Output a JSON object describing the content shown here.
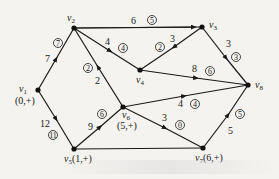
{
  "diagram": {
    "type": "network-flow",
    "nodes": [
      {
        "id": "v1",
        "name": "v",
        "sub": "1",
        "mark": "(0,+)",
        "x": 38,
        "y": 90
      },
      {
        "id": "v2",
        "name": "v",
        "sub": "2",
        "mark": "",
        "x": 74,
        "y": 28
      },
      {
        "id": "v3",
        "name": "v",
        "sub": "3",
        "mark": "",
        "x": 202,
        "y": 27
      },
      {
        "id": "v4",
        "name": "v",
        "sub": "4",
        "mark": "",
        "x": 140,
        "y": 70
      },
      {
        "id": "v5",
        "name": "v",
        "sub": "5",
        "mark": "(1,+)",
        "x": 74,
        "y": 149
      },
      {
        "id": "v6",
        "name": "v",
        "sub": "6",
        "mark": "(5,+)",
        "x": 123,
        "y": 107
      },
      {
        "id": "v7",
        "name": "v",
        "sub": "7",
        "mark": "(6,+)",
        "x": 203,
        "y": 148
      },
      {
        "id": "v8",
        "name": "v",
        "sub": "8",
        "mark": "",
        "x": 248,
        "y": 85
      }
    ],
    "edges": [
      {
        "from": "v1",
        "to": "v2",
        "capacity": "7",
        "flow": "7"
      },
      {
        "from": "v1",
        "to": "v5",
        "capacity": "12",
        "flow": "11"
      },
      {
        "from": "v2",
        "to": "v3",
        "capacity": "6",
        "flow": "5"
      },
      {
        "from": "v2",
        "to": "v4",
        "capacity": "4",
        "flow": "4"
      },
      {
        "from": "v6",
        "to": "v2",
        "capacity": "2",
        "flow": "2"
      },
      {
        "from": "v3",
        "to": "v4",
        "capacity": "3",
        "flow": "2"
      },
      {
        "from": "v3",
        "to": "v8",
        "capacity": "3",
        "flow": "3"
      },
      {
        "from": "v4",
        "to": "v8",
        "capacity": "8",
        "flow": "6"
      },
      {
        "from": "v5",
        "to": "v6",
        "capacity": "9",
        "flow": "6"
      },
      {
        "from": "v6",
        "to": "v8",
        "capacity": "4",
        "flow": "4"
      },
      {
        "from": "v6",
        "to": "v7",
        "capacity": "3",
        "flow": "0"
      },
      {
        "from": "v7",
        "to": "v8",
        "capacity": "5",
        "flow": "5"
      },
      {
        "from": "v5",
        "to": "v7",
        "capacity": "",
        "flow": ""
      }
    ]
  },
  "labels": {
    "v1": {
      "name": "v",
      "sub": "1",
      "mark": "(0,+)"
    },
    "v2": {
      "name": "v",
      "sub": "2"
    },
    "v3": {
      "name": "v",
      "sub": "3"
    },
    "v4": {
      "name": "v",
      "sub": "4"
    },
    "v5": {
      "name": "v",
      "sub": "5",
      "mark": "(1,+)"
    },
    "v6": {
      "name": "v",
      "sub": "6",
      "mark": "(5,+)"
    },
    "v7": {
      "name": "v",
      "sub": "7",
      "mark": "(6,+)"
    },
    "v8": {
      "name": "v",
      "sub": "8"
    },
    "e12": {
      "cap": "7",
      "flow": "7"
    },
    "e15": {
      "cap": "12",
      "flow": "11"
    },
    "e23": {
      "cap": "6",
      "flow": "5"
    },
    "e24": {
      "cap": "4",
      "flow": "4"
    },
    "e62": {
      "cap": "2",
      "flow": "2"
    },
    "e34": {
      "cap": "3",
      "flow": "2"
    },
    "e38": {
      "cap": "3",
      "flow": "3"
    },
    "e48": {
      "cap": "8",
      "flow": "6"
    },
    "e56": {
      "cap": "9",
      "flow": "6"
    },
    "e68": {
      "cap": "4",
      "flow": "4"
    },
    "e67": {
      "cap": "3",
      "flow": "0"
    },
    "e78": {
      "cap": "5",
      "flow": "5"
    }
  }
}
